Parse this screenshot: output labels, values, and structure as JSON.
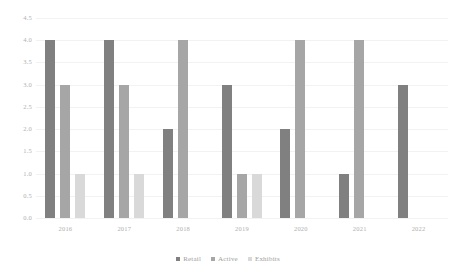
{
  "chart_data": {
    "type": "bar",
    "title": "",
    "subtitle": "",
    "xlabel": "",
    "ylabel": "",
    "categories": [
      "2016",
      "2017",
      "2018",
      "2019",
      "2020",
      "2021",
      "2022"
    ],
    "series": [
      {
        "name": "Retail",
        "color": "#808080",
        "values": [
          4,
          4,
          2,
          3,
          2,
          1,
          3
        ]
      },
      {
        "name": "Active",
        "color": "#a6a6a6",
        "values": [
          3,
          3,
          4,
          1,
          4,
          4,
          0
        ]
      },
      {
        "name": "Exhibits",
        "color": "#d9d9d9",
        "values": [
          1,
          1,
          0,
          1,
          0,
          0,
          0
        ]
      }
    ],
    "ylim": [
      0.0,
      4.5
    ],
    "ytick_step": 0.5,
    "yticks": [
      "0.0",
      "0.5",
      "1.0",
      "1.5",
      "2.0",
      "2.5",
      "3.0",
      "3.5",
      "4.0",
      "4.5"
    ],
    "grid": true,
    "grid_color": "#f2f2f2",
    "legend_position": "bottom",
    "background_color": "#ffffff",
    "text_color": "#b0b0b0",
    "bar_orientation": "vertical",
    "grouped": true
  },
  "legend": {
    "items": [
      {
        "label": "Retail",
        "color": "#808080"
      },
      {
        "label": "Active",
        "color": "#a6a6a6"
      },
      {
        "label": "Exhibits",
        "color": "#d9d9d9"
      }
    ]
  }
}
